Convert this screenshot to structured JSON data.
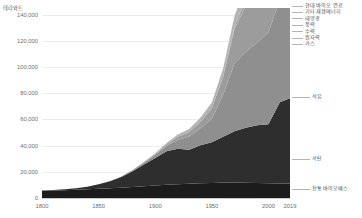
{
  "chart_data": {
    "type": "area",
    "title": "",
    "subtitle": "",
    "unit_label": "테라와트",
    "xlabel": "",
    "ylabel": "",
    "xlim": [
      1800,
      2019
    ],
    "ylim": [
      0,
      145000
    ],
    "grid": true,
    "legend_position": "right",
    "stacked": true,
    "x_ticks": [
      "1800",
      "1850",
      "1900",
      "1950",
      "2000",
      "2019"
    ],
    "x_tick_values": [
      1800,
      1850,
      1900,
      1950,
      2000,
      2019
    ],
    "y_ticks": [
      "0",
      "20,000",
      "40,000",
      "60,000",
      "80,000",
      "100,000",
      "120,000",
      "140,000"
    ],
    "y_tick_values": [
      0,
      20000,
      40000,
      60000,
      80000,
      100000,
      120000,
      140000
    ],
    "x": [
      1800,
      1810,
      1820,
      1830,
      1840,
      1850,
      1860,
      1870,
      1880,
      1890,
      1900,
      1910,
      1920,
      1930,
      1940,
      1950,
      1960,
      1970,
      1980,
      1990,
      2000,
      2010,
      2019
    ],
    "series": [
      {
        "name": "전통 바이오매스",
        "color": "#1c1c1c",
        "values": [
          5600,
          5800,
          6000,
          6300,
          6600,
          7000,
          7400,
          7900,
          8400,
          9000,
          9600,
          10100,
          10500,
          10900,
          11200,
          11500,
          11800,
          11900,
          11700,
          11500,
          11300,
          11100,
          11100
        ]
      },
      {
        "name": "석탄",
        "color": "#2e2e2e",
        "values": [
          200,
          400,
          700,
          1200,
          2000,
          3400,
          5400,
          8200,
          12000,
          16500,
          21000,
          25500,
          27000,
          26000,
          29000,
          31000,
          35000,
          39000,
          42000,
          44000,
          45000,
          62000,
          65000
        ]
      },
      {
        "name": "석유",
        "color": "#8f8f8f",
        "values": [
          0,
          0,
          0,
          0,
          0,
          0,
          100,
          300,
          700,
          1400,
          2300,
          4000,
          7000,
          10000,
          13000,
          18000,
          32000,
          52000,
          58000,
          63000,
          70000,
          78000,
          80000
        ]
      },
      {
        "name": "가스",
        "color": "#9c9c9c",
        "values": [
          0,
          0,
          0,
          0,
          0,
          0,
          0,
          100,
          200,
          400,
          700,
          1200,
          2200,
          3400,
          5000,
          8000,
          14000,
          26000,
          35000,
          44000,
          53000,
          66000,
          72000
        ]
      },
      {
        "name": "원자력",
        "color": "#a8a8a8",
        "values": [
          0,
          0,
          0,
          0,
          0,
          0,
          0,
          0,
          0,
          0,
          0,
          0,
          0,
          0,
          0,
          0,
          300,
          2000,
          6500,
          12000,
          14500,
          15000,
          14500
        ]
      },
      {
        "name": "수력",
        "color": "#b3b3b3",
        "values": [
          0,
          0,
          0,
          0,
          0,
          0,
          0,
          0,
          100,
          300,
          600,
          1100,
          1700,
          2400,
          3200,
          4400,
          6000,
          8000,
          10000,
          12000,
          14000,
          17000,
          19000
        ]
      },
      {
        "name": "풍력",
        "color": "#bdbdbd",
        "values": [
          0,
          0,
          0,
          0,
          0,
          0,
          0,
          0,
          0,
          0,
          0,
          0,
          0,
          0,
          0,
          0,
          0,
          0,
          0,
          100,
          700,
          2500,
          6500
        ]
      },
      {
        "name": "태양광",
        "color": "#c6c6c6",
        "values": [
          0,
          0,
          0,
          0,
          0,
          0,
          0,
          0,
          0,
          0,
          0,
          0,
          0,
          0,
          0,
          0,
          0,
          0,
          0,
          0,
          100,
          600,
          4000
        ]
      },
      {
        "name": "기타 재생에너지",
        "color": "#d0d0d0",
        "values": [
          0,
          0,
          0,
          0,
          0,
          0,
          0,
          0,
          0,
          0,
          0,
          0,
          0,
          0,
          0,
          0,
          100,
          300,
          700,
          1300,
          2200,
          3500,
          5000
        ]
      },
      {
        "name": "현대 바이오 연료",
        "color": "#dadada",
        "values": [
          0,
          0,
          0,
          0,
          0,
          0,
          0,
          0,
          0,
          0,
          0,
          0,
          0,
          0,
          0,
          0,
          0,
          0,
          100,
          300,
          700,
          2000,
          3000
        ]
      }
    ],
    "legend_entries": [
      {
        "label": "현대 바이오 연료",
        "color": "#dadada"
      },
      {
        "label": "기타 재생에너지",
        "color": "#d0d0d0"
      },
      {
        "label": "태양광",
        "color": "#c6c6c6"
      },
      {
        "label": "풍력",
        "color": "#bdbdbd"
      },
      {
        "label": "수력",
        "color": "#b3b3b3"
      },
      {
        "label": "원자력",
        "color": "#a8a8a8"
      },
      {
        "label": "가스",
        "color": "#9c9c9c"
      }
    ],
    "inline_labels": [
      {
        "label": "석유",
        "color": "#8f8f8f"
      },
      {
        "label": "석탄",
        "color": "#2e2e2e"
      },
      {
        "label": "전통 바이오매스",
        "color": "#1c1c1c"
      }
    ],
    "colors": {
      "background": "#ffffff",
      "grid": "#ececec",
      "axis_text": "#6e6e6e",
      "label_text": "#4a4a4a"
    }
  }
}
